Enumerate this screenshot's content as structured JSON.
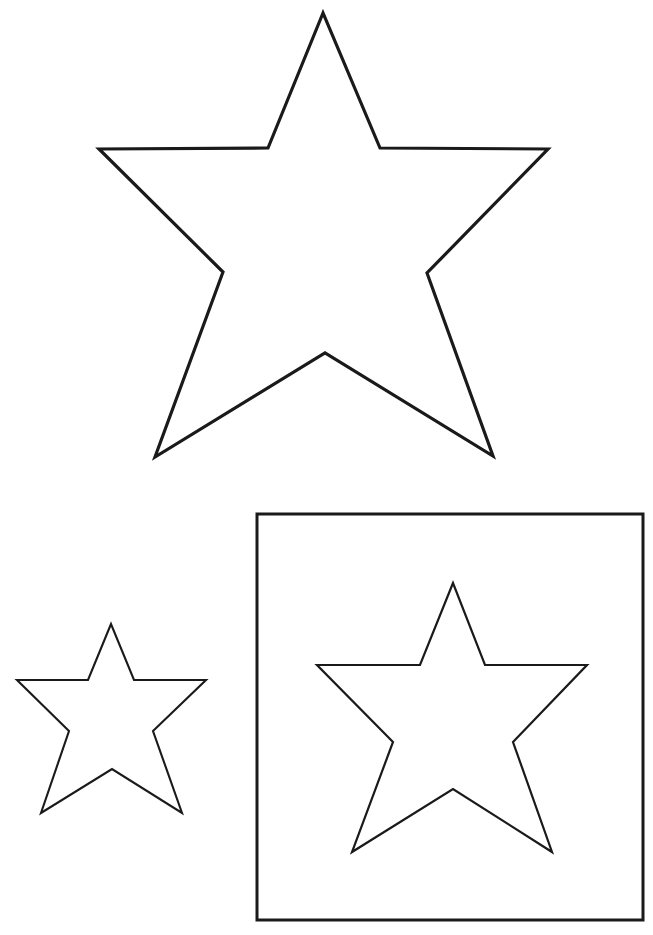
{
  "page": {
    "background_color": "#ffffff",
    "ink_color": "#1a1a1a",
    "width": 653,
    "height": 935
  },
  "shapes": [
    {
      "id": "star-large",
      "kind": "five-pointed-star",
      "label": "Large star",
      "fill": "#ffffff",
      "stroke": "#1a1a1a",
      "stroke_width": 3.2,
      "bounds": {
        "x": 99,
        "y": 13,
        "width": 449,
        "height": 444
      },
      "points": "323,13 268,148 99,149 223,272 155,457 325,353 493,456 427,273 548,149 380,148"
    },
    {
      "id": "star-small",
      "kind": "five-pointed-star",
      "label": "Small star",
      "fill": "#ffffff",
      "stroke": "#1a1a1a",
      "stroke_width": 2.1,
      "bounds": {
        "x": 17,
        "y": 624,
        "width": 189,
        "height": 189
      },
      "points": "111,624 88,680 17,680 69,731 41,813 112,769 182,813 153,731 206,680 134,680"
    },
    {
      "id": "frame-square",
      "kind": "square",
      "label": "Square frame",
      "fill": "#ffffff",
      "stroke": "#1a1a1a",
      "stroke_width": 3.0,
      "bounds": {
        "x": 257,
        "y": 514,
        "width": 386,
        "height": 406
      }
    },
    {
      "id": "star-medium",
      "kind": "five-pointed-star",
      "label": "Medium star inside square",
      "fill": "#ffffff",
      "stroke": "#1a1a1a",
      "stroke_width": 2.2,
      "bounds": {
        "x": 317,
        "y": 583,
        "width": 270,
        "height": 269
      },
      "points": "453,583 420,665 317,665 393,742 352,852 453,789 552,852 513,742 587,665 485,665"
    }
  ]
}
